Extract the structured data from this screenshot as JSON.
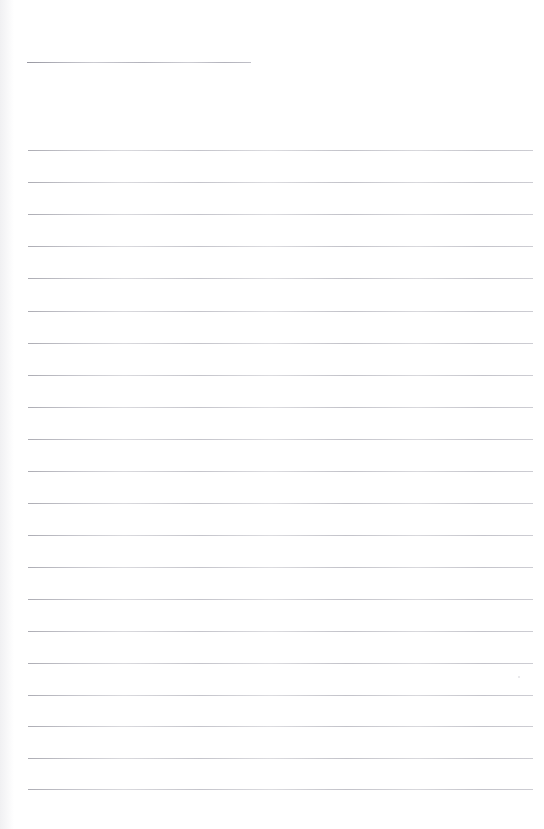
{
  "document": {
    "kind": "scanned-ruled-paper",
    "title_line_label": "",
    "body_text": "",
    "page_width": 544,
    "page_height": 829,
    "background_color": "#fefefe",
    "rule_color": "#c9c9cf",
    "header_rule_color": "#bcbcc4"
  },
  "header_rule": {
    "name": "title-rule",
    "x": 27,
    "y": 62,
    "width": 224
  },
  "rules": [
    {
      "index": 1,
      "x": 28,
      "y": 150,
      "width": 505
    },
    {
      "index": 2,
      "x": 28,
      "y": 182,
      "width": 505
    },
    {
      "index": 3,
      "x": 28,
      "y": 214,
      "width": 505
    },
    {
      "index": 4,
      "x": 28,
      "y": 246,
      "width": 505
    },
    {
      "index": 5,
      "x": 28,
      "y": 278,
      "width": 505
    },
    {
      "index": 6,
      "x": 28,
      "y": 311,
      "width": 505
    },
    {
      "index": 7,
      "x": 28,
      "y": 343,
      "width": 505
    },
    {
      "index": 8,
      "x": 28,
      "y": 375,
      "width": 505
    },
    {
      "index": 9,
      "x": 28,
      "y": 407,
      "width": 505
    },
    {
      "index": 10,
      "x": 28,
      "y": 439,
      "width": 505
    },
    {
      "index": 11,
      "x": 28,
      "y": 471,
      "width": 505
    },
    {
      "index": 12,
      "x": 28,
      "y": 503,
      "width": 505
    },
    {
      "index": 13,
      "x": 28,
      "y": 535,
      "width": 505
    },
    {
      "index": 14,
      "x": 28,
      "y": 567,
      "width": 505
    },
    {
      "index": 15,
      "x": 28,
      "y": 599,
      "width": 505
    },
    {
      "index": 16,
      "x": 28,
      "y": 631,
      "width": 505
    },
    {
      "index": 17,
      "x": 28,
      "y": 663,
      "width": 505
    },
    {
      "index": 18,
      "x": 28,
      "y": 695,
      "width": 505
    },
    {
      "index": 19,
      "x": 28,
      "y": 726,
      "width": 505
    },
    {
      "index": 20,
      "x": 28,
      "y": 758,
      "width": 505
    },
    {
      "index": 21,
      "x": 28,
      "y": 789,
      "width": 505
    }
  ],
  "specks": [
    {
      "x": 518,
      "y": 676,
      "size": 2
    }
  ]
}
